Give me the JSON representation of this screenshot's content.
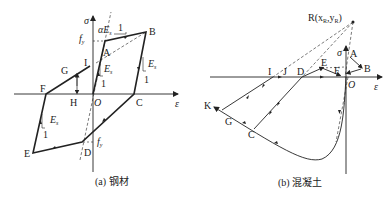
{
  "figure": {
    "colors": {
      "ink": "#222222",
      "background": "#ffffff"
    },
    "panel_a": {
      "caption": "(a) 钢材",
      "axis_x_label": "ε",
      "axis_y_label": "σ",
      "origin_label": "O",
      "points": {
        "A": "A",
        "B": "B",
        "C": "C",
        "D": "D",
        "E": "E",
        "F": "F",
        "G": "G",
        "H": "H",
        "I": "I"
      },
      "fy_top": "f",
      "fy_top_sub": "y",
      "fy_bottom": "f",
      "fy_bottom_sub": "y",
      "slope_label": "αE",
      "slope_label_sub": "s",
      "slope_one": "1",
      "es_label": "E",
      "es_sub": "s",
      "es_one": "1"
    },
    "panel_b": {
      "caption": "(b) 混凝土",
      "axis_x_label": "ε",
      "axis_y_label": "σ",
      "origin_label": "O",
      "focal_point_label": "R(x",
      "focal_point_sub1": "R",
      "focal_point_mid": ",y",
      "focal_point_sub2": "R",
      "focal_point_end": ")",
      "points": {
        "A": "A",
        "B": "B",
        "C": "C",
        "D": "D",
        "E": "E",
        "F": "F",
        "G": "G",
        "I": "I",
        "J": "J",
        "K": "K"
      }
    }
  }
}
